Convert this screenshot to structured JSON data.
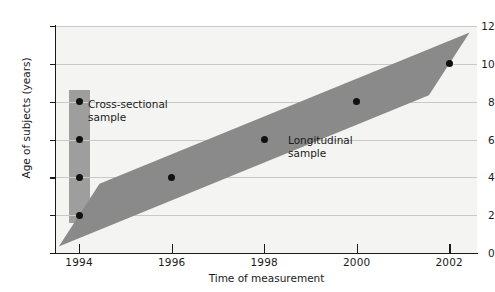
{
  "chart_data": {
    "type": "scatter",
    "title": "",
    "xlabel": "Time of measurement",
    "ylabel": "Age of subjects (years)",
    "xlim": [
      1993.5,
      2002.6
    ],
    "ylim": [
      0,
      12
    ],
    "grid": true,
    "legend": "none",
    "x_ticks": [
      1994,
      1996,
      1998,
      2000,
      2002
    ],
    "x_tick_labels": [
      "1994",
      "1996",
      "1998",
      "2000",
      "2002"
    ],
    "y_ticks": [
      0,
      2,
      4,
      6,
      8,
      10,
      12
    ],
    "y_tick_labels": [
      "0",
      "2",
      "4",
      "6",
      "8",
      "10",
      "12"
    ],
    "series": [
      {
        "name": "Cross-sectional sample",
        "type": "scatter",
        "x": [
          1994,
          1994,
          1994,
          1994
        ],
        "y": [
          2,
          4,
          6,
          8
        ],
        "color": "#111111"
      },
      {
        "name": "Longitudinal sample",
        "type": "scatter",
        "x": [
          1994,
          1996,
          1998,
          2000,
          2002
        ],
        "y": [
          2,
          4,
          6,
          8,
          10
        ],
        "color": "#111111"
      }
    ],
    "bands": [
      {
        "name": "cross-sectional-band",
        "orientation": "vertical",
        "x": 1994,
        "y_from": 1.6,
        "y_to": 8.6,
        "color": "#9e9e9e"
      },
      {
        "name": "longitudinal-band",
        "orientation": "diagonal",
        "from": {
          "x": 1994,
          "y": 2
        },
        "to": {
          "x": 2002,
          "y": 10
        },
        "thickness_years": 0.8,
        "color": "#8a8a8a"
      }
    ],
    "annotations": [
      {
        "name": "cross-sectional",
        "text": "Cross-sectional\nsample",
        "x": 1994.4,
        "y": 7.3
      },
      {
        "name": "longitudinal",
        "text": "Longitudinal\nsample",
        "x": 1998.2,
        "y": 5.4
      }
    ],
    "colors": {
      "plot_background": "#f4f4f3",
      "gridline": "#c9c9c9",
      "axis": "#1a1a1a",
      "cross_sectional_band": "#9e9e9e",
      "longitudinal_band": "#8a8a8a",
      "point": "#111111",
      "text": "#1a1a1a"
    }
  }
}
